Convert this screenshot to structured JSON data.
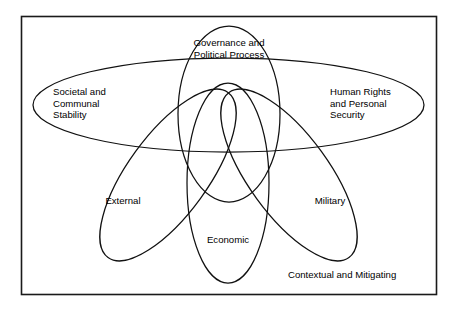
{
  "diagram": {
    "type": "venn-overlapping-ellipses",
    "frame_label": "Contextual and Mitigating",
    "background_color": "#ffffff",
    "stroke_color": "#111111",
    "frame_color": "#1a1a1a",
    "sets": [
      {
        "id": "governance",
        "label_lines": [
          "Governance and",
          "Political Process"
        ],
        "label_line_1": "Governance and",
        "label_line_2": "Political Process",
        "position": "top-center",
        "shape": "large-circle"
      },
      {
        "id": "societal",
        "label_lines": [
          "Societal and",
          "Communal",
          "Stability"
        ],
        "label_line_1": "Societal and",
        "label_line_2": "Communal",
        "label_line_3": "Stability",
        "position": "left",
        "shape": "wide-horizontal-ellipse-left-lobe"
      },
      {
        "id": "human-rights",
        "label_lines": [
          "Human Rights",
          "and Personal",
          "Security"
        ],
        "label_line_1": "Human Rights",
        "label_line_2": "and Personal",
        "label_line_3": "Security",
        "position": "right",
        "shape": "wide-horizontal-ellipse-right-lobe"
      },
      {
        "id": "external",
        "label_lines": [
          "External"
        ],
        "label_line_1": "External",
        "position": "lower-left",
        "shape": "narrow-tilted-ellipse"
      },
      {
        "id": "military",
        "label_lines": [
          "Military"
        ],
        "label_line_1": "Military",
        "position": "lower-right",
        "shape": "narrow-tilted-ellipse"
      },
      {
        "id": "economic",
        "label_lines": [
          "Economic"
        ],
        "label_line_1": "Economic",
        "position": "bottom-center",
        "shape": "narrow-vertical-ellipse"
      }
    ]
  }
}
